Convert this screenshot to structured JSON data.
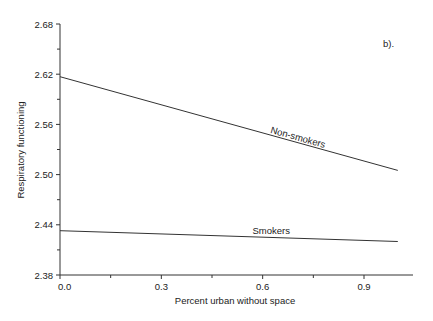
{
  "chart_data": {
    "type": "line",
    "title": "",
    "panel_label": "b).",
    "xlabel": "Percent urban without space",
    "ylabel": "Respiratory functioning",
    "xlim": [
      0.0,
      1.05
    ],
    "ylim": [
      2.38,
      2.68
    ],
    "x_ticks": [
      0.0,
      0.3,
      0.6,
      0.9
    ],
    "x_tick_labels": [
      "0.0",
      "0.3",
      "0.6",
      "0.9"
    ],
    "y_ticks": [
      2.38,
      2.44,
      2.5,
      2.56,
      2.62,
      2.68
    ],
    "y_tick_labels": [
      "2.38",
      "2.44",
      "2.50",
      "2.56",
      "2.62",
      "2.68"
    ],
    "grid": false,
    "legend": "inline labels on lines",
    "series": [
      {
        "name": "Non-smokers",
        "x": [
          0.0,
          1.0
        ],
        "values": [
          2.617,
          2.505
        ]
      },
      {
        "name": "Smokers",
        "x": [
          0.0,
          1.0
        ],
        "values": [
          2.433,
          2.42
        ]
      }
    ]
  }
}
